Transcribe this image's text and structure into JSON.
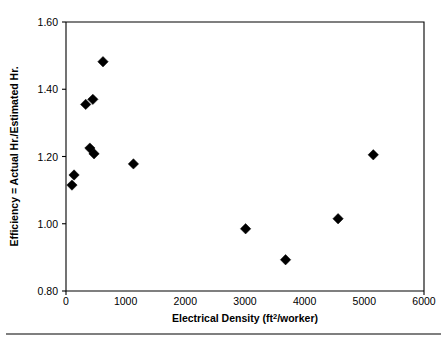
{
  "chart_data": {
    "type": "scatter",
    "title": "",
    "xlabel": "Electrical Density (ft2/worker)",
    "xlabel_base": "Electrical Density (ft",
    "xlabel_sup": "2",
    "xlabel_tail": "/worker)",
    "ylabel": "Efficiency = Actual Hr./Estimated Hr.",
    "xlim": [
      0,
      6000
    ],
    "ylim": [
      0.8,
      1.6
    ],
    "xticks": [
      0,
      1000,
      2000,
      3000,
      4000,
      5000,
      6000
    ],
    "xtick_labels": [
      "0",
      "1000",
      "2000",
      "3000",
      "4000",
      "5000",
      "6000"
    ],
    "yticks": [
      0.8,
      1.0,
      1.2,
      1.4,
      1.6
    ],
    "ytick_labels": [
      "0.80",
      "1.00",
      "1.20",
      "1.40",
      "1.60"
    ],
    "grid": false,
    "legend": "none",
    "marker_shape": "diamond",
    "marker_color": "#000000",
    "points": [
      {
        "x": 100,
        "y": 1.115
      },
      {
        "x": 135,
        "y": 1.145
      },
      {
        "x": 330,
        "y": 1.355
      },
      {
        "x": 450,
        "y": 1.37
      },
      {
        "x": 400,
        "y": 1.225
      },
      {
        "x": 470,
        "y": 1.208
      },
      {
        "x": 620,
        "y": 1.482
      },
      {
        "x": 1130,
        "y": 1.178
      },
      {
        "x": 3010,
        "y": 0.985
      },
      {
        "x": 3680,
        "y": 0.893
      },
      {
        "x": 4560,
        "y": 1.015
      },
      {
        "x": 5150,
        "y": 1.205
      }
    ]
  },
  "figure": {
    "background_color": "#ffffff",
    "axis_color": "#000000",
    "rule_color": "#000000"
  }
}
